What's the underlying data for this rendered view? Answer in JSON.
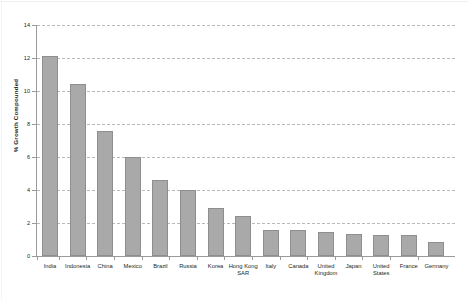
{
  "chart_data": {
    "type": "bar",
    "title": "",
    "subtitle": "",
    "xlabel": "",
    "ylabel": "% Growth Compounded",
    "ylim": [
      0,
      14
    ],
    "ytick_step": 2,
    "yticks": [
      "0",
      "2",
      "4",
      "6",
      "8",
      "10",
      "12",
      "14"
    ],
    "grid": "horizontal-dashed",
    "legend": "none",
    "orientation": "vertical",
    "bar_color": "#a9a9a9",
    "bar_edge_color": "#8e8e8e",
    "gridline_color": "#b9b9b9",
    "axis_color": "#9a9a9a",
    "categories": [
      "India",
      "Indonesia",
      "China",
      "Mexico",
      "Brazil",
      "Russia",
      "Korea",
      "Hong Kong SAR",
      "Italy",
      "Canada",
      "United Kingdom",
      "Japan",
      "United States",
      "France",
      "Germany"
    ],
    "values": [
      12.1,
      10.4,
      7.6,
      6.0,
      4.6,
      4.0,
      2.9,
      2.4,
      1.6,
      1.55,
      1.45,
      1.35,
      1.3,
      1.3,
      0.85
    ]
  },
  "figure": {
    "caption_clipped": "",
    "background": "#ffffff"
  }
}
